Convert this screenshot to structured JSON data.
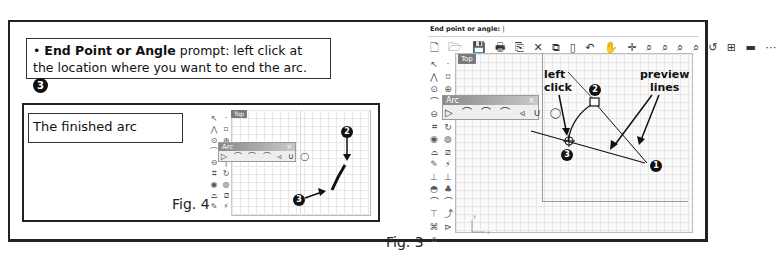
{
  "instruction": {
    "bullet": "•",
    "bold_term": "End Point or Angle",
    "text": " prompt: left click at the location where you want to end the arc.",
    "step_badge": "3"
  },
  "fig4": {
    "caption": "The finished arc",
    "label": "Fig. 4",
    "viewport_tab": "Top",
    "arc_panel_title": "Arc",
    "arc_panel_close": "×",
    "arc_tools": "▷ ⌒ ⌒ ⌒ ◃ ∪ ◯",
    "callouts": [
      "2",
      "3"
    ]
  },
  "fig3": {
    "label": "Fig. 3",
    "command_prompt": "End point or angle:",
    "viewport_tab": "Top",
    "arc_panel_title": "Arc",
    "arc_panel_close": "×",
    "arc_tools": "▷ ⌒ ⌒ ⌒ ◃ ∪ ◯",
    "main_toolbar_icons": [
      "new-file",
      "open",
      "save",
      "print",
      "paste-special",
      "cut",
      "copy",
      "paste",
      "undo",
      "pan",
      "rotate",
      "zoom",
      "zoom-window",
      "zoom-extents",
      "zoom-selected",
      "undo-view",
      "four-viewports",
      "car",
      "more"
    ],
    "main_toolbar_glyphs": "🗋 🗁 💾 🖶 ⎘ ✕ ⧉ ▯ ↶ ✋ ✛ ⌕ ⌕ ⌕ ⌕ ↺ ⊞ ▬ ⋯",
    "callout_left_click": [
      "left",
      "click"
    ],
    "callout_preview_lines": [
      "preview",
      "lines"
    ],
    "badges": [
      "1",
      "2",
      "3"
    ],
    "axis_x": "x",
    "axis_y": "y"
  },
  "side_toolbar_glyphs": {
    "left": [
      "↖",
      "⋀",
      "⊙",
      "⌒",
      "⊖",
      "⌗",
      "◉",
      "⌓",
      "✎",
      "⊥",
      "◓",
      "⌒",
      "⊤",
      "⌘",
      "⌂"
    ],
    "right": [
      "·",
      "⌑",
      "⊕",
      "⌒",
      "|",
      "↻",
      "◍",
      "⧄",
      "⚡",
      "⊥",
      "♣",
      "⌒",
      "⤴",
      "⊳",
      ""
    ]
  }
}
